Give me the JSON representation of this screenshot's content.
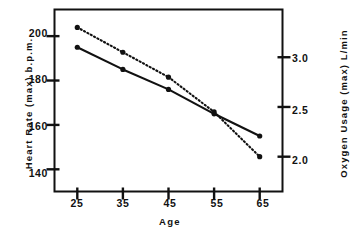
{
  "chart_data": {
    "type": "line",
    "title": "",
    "xlabel": "Age",
    "categories": [
      25,
      35,
      45,
      55,
      65
    ],
    "x": [
      25,
      35,
      45,
      55,
      65
    ],
    "xlim": [
      20,
      70
    ],
    "xticks": [
      25,
      35,
      45,
      55,
      65
    ],
    "xticklabels": [
      "25",
      "35",
      "45",
      "55",
      "65"
    ],
    "grid": false,
    "legend": "none",
    "axes": {
      "left": {
        "label": "Heart Rate (max) b.p.m.",
        "ticks": [
          140,
          160,
          180,
          200
        ],
        "ticklabels": [
          "140",
          "160",
          "180",
          "200"
        ],
        "lim": [
          130,
          212
        ]
      },
      "right": {
        "label": "Oxygen Usage (max) L/min",
        "ticks": [
          2.0,
          2.5,
          3.0
        ],
        "ticklabels": [
          "2.0",
          "2.5",
          "3.0"
        ],
        "lim": [
          1.65,
          3.48
        ]
      }
    },
    "series": [
      {
        "name": "Heart Rate (max) b.p.m.",
        "axis": "left",
        "style": "solid",
        "marker": "filled-circle",
        "color": "#111111",
        "units": "b.p.m.",
        "values": [
          195,
          185,
          176,
          165,
          155
        ]
      },
      {
        "name": "Oxygen Usage (max) L/min",
        "axis": "right",
        "style": "dotted",
        "marker": "filled-circle",
        "color": "#111111",
        "units": "L/min",
        "values": [
          3.3,
          3.05,
          2.8,
          2.45,
          2.0
        ]
      }
    ]
  },
  "frame": {
    "color": "#111111"
  }
}
